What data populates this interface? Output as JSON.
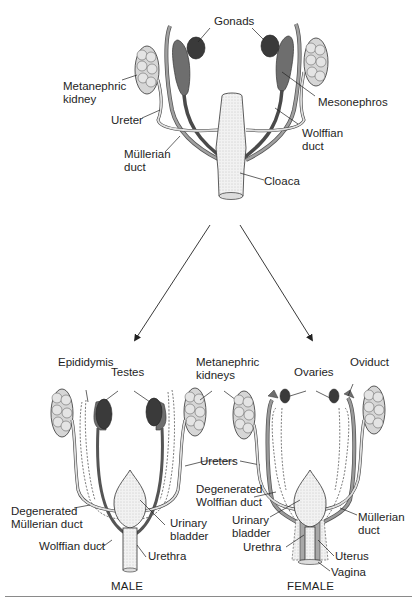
{
  "figure": {
    "top_diagram": {
      "labels": {
        "gonads": "Gonads",
        "metanephric_kidney": "Metanephric\nkidney",
        "mesonephros": "Mesonephros",
        "ureter": "Ureter",
        "wolffian_duct": "Wolffian\nduct",
        "mullerian_duct": "Müllerian\nduct",
        "cloaca": "Cloaca"
      }
    },
    "male_diagram": {
      "caption": "MALE",
      "labels": {
        "epididymis": "Epididymis",
        "testes": "Testes",
        "degenerated_mullerian_duct": "Degenerated\nMüllerian duct",
        "wolffian_duct": "Wolffian duct",
        "urinary_bladder": "Urinary\nbladder",
        "urethra": "Urethra"
      }
    },
    "shared_labels": {
      "metanephric_kidneys": "Metanephric\nkidneys",
      "ureters": "Ureters"
    },
    "female_diagram": {
      "caption": "FEMALE",
      "labels": {
        "ovaries": "Ovaries",
        "oviduct": "Oviduct",
        "degenerated_wolffian_duct": "Degenerated\nWolffian duct",
        "urinary_bladder": "Urinary\nbladder",
        "urethra": "Urethra",
        "mullerian_duct": "Müllerian\nduct",
        "uterus": "Uterus",
        "vagina": "Vagina"
      }
    },
    "colors": {
      "gonad": "#3a3a3a",
      "mesonephros": "#6e6e6e",
      "wolffian": "#5a5a5a",
      "mullerian": "#9a9a9a",
      "kidney": "#d8d8d8",
      "bladder": "#ececec",
      "line": "#222222"
    }
  }
}
